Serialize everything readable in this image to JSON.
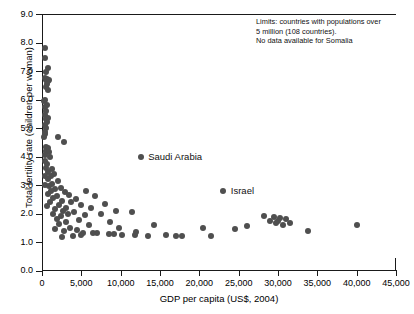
{
  "chart_data": {
    "type": "scatter",
    "title": "",
    "xlabel": "GDP per capita (US$, 2004)",
    "ylabel": "Total fertility rate (children per woman)",
    "xlim": [
      0,
      45000
    ],
    "ylim": [
      0,
      9.0
    ],
    "xticks": [
      0,
      5000,
      10000,
      15000,
      20000,
      25000,
      30000,
      35000,
      40000,
      45000
    ],
    "xtick_labels": [
      "0",
      "5,000",
      "10,000",
      "15,000",
      "20,000",
      "25,000",
      "30,000",
      "35,000",
      "40,000",
      "45,000"
    ],
    "yticks": [
      0,
      1,
      2,
      3,
      4,
      5,
      6,
      7,
      8,
      9
    ],
    "ytick_labels": [
      "0.0",
      "1.0",
      "2.0",
      "3.0",
      "4.0",
      "5.0",
      "6.0",
      "7.0",
      "8.0",
      "9.0"
    ],
    "grid": false,
    "legend": null,
    "marker_color": "#4f4f4f",
    "marker_size_px": 6,
    "annotations": [
      {
        "name": "limits-note",
        "lines": [
          "Limits: countries with populations over",
          "5 million (108 countries).",
          "No data available for Somalia"
        ],
        "x": 26000,
        "y": 8.85
      },
      {
        "name": "saudi-arabia-label",
        "text": "Saudi Arabia",
        "x": 13500,
        "y": 4.0,
        "point": [
          12600,
          4.0
        ]
      },
      {
        "name": "israel-label",
        "text": "Israel",
        "x": 24000,
        "y": 2.8,
        "point": [
          23000,
          2.8
        ]
      }
    ],
    "points": [
      [
        350,
        7.8
      ],
      [
        420,
        7.45
      ],
      [
        700,
        7.1
      ],
      [
        480,
        6.95
      ],
      [
        330,
        6.75
      ],
      [
        500,
        6.7
      ],
      [
        620,
        6.72
      ],
      [
        780,
        6.65
      ],
      [
        900,
        6.7
      ],
      [
        660,
        6.55
      ],
      [
        560,
        6.45
      ],
      [
        820,
        6.35
      ],
      [
        330,
        6.0
      ],
      [
        300,
        5.95
      ],
      [
        620,
        5.8
      ],
      [
        420,
        5.75
      ],
      [
        560,
        5.6
      ],
      [
        380,
        5.45
      ],
      [
        700,
        5.35
      ],
      [
        500,
        5.3
      ],
      [
        640,
        5.2
      ],
      [
        340,
        5.1
      ],
      [
        560,
        5.0
      ],
      [
        330,
        4.85
      ],
      [
        430,
        4.8
      ],
      [
        300,
        4.7
      ],
      [
        2050,
        4.7
      ],
      [
        2750,
        4.5
      ],
      [
        480,
        4.35
      ],
      [
        700,
        4.3
      ],
      [
        560,
        4.2
      ],
      [
        900,
        4.15
      ],
      [
        380,
        4.05
      ],
      [
        1050,
        4.0
      ],
      [
        12600,
        4.0
      ],
      [
        330,
        3.85
      ],
      [
        620,
        3.75
      ],
      [
        500,
        3.6
      ],
      [
        1250,
        3.55
      ],
      [
        820,
        3.45
      ],
      [
        1500,
        3.4
      ],
      [
        350,
        3.3
      ],
      [
        1100,
        3.3
      ],
      [
        700,
        3.2
      ],
      [
        2050,
        3.15
      ],
      [
        1300,
        3.05
      ],
      [
        400,
        3.0
      ],
      [
        900,
        2.95
      ],
      [
        2400,
        2.9
      ],
      [
        1700,
        2.85
      ],
      [
        1150,
        2.8
      ],
      [
        5600,
        2.8
      ],
      [
        23000,
        2.8
      ],
      [
        2900,
        2.75
      ],
      [
        780,
        2.7
      ],
      [
        3400,
        2.65
      ],
      [
        1900,
        2.6
      ],
      [
        6700,
        2.6
      ],
      [
        1400,
        2.55
      ],
      [
        4300,
        2.5
      ],
      [
        2550,
        2.45
      ],
      [
        3700,
        2.4
      ],
      [
        1050,
        2.4
      ],
      [
        8000,
        2.35
      ],
      [
        2150,
        2.3
      ],
      [
        5000,
        2.3
      ],
      [
        620,
        2.25
      ],
      [
        3100,
        2.2
      ],
      [
        6200,
        2.2
      ],
      [
        1700,
        2.15
      ],
      [
        9400,
        2.1
      ],
      [
        2700,
        2.1
      ],
      [
        4100,
        2.05
      ],
      [
        11500,
        2.05
      ],
      [
        1350,
        2.0
      ],
      [
        3300,
        2.0
      ],
      [
        7500,
        1.98
      ],
      [
        5500,
        1.95
      ],
      [
        2400,
        1.9
      ],
      [
        28200,
        1.9
      ],
      [
        29500,
        1.88
      ],
      [
        30300,
        1.85
      ],
      [
        31000,
        1.8
      ],
      [
        1900,
        1.8
      ],
      [
        4700,
        1.78
      ],
      [
        29000,
        1.75
      ],
      [
        30000,
        1.72
      ],
      [
        8600,
        1.7
      ],
      [
        3000,
        1.7
      ],
      [
        29800,
        1.68
      ],
      [
        31500,
        1.65
      ],
      [
        2200,
        1.62
      ],
      [
        6000,
        1.6
      ],
      [
        14200,
        1.6
      ],
      [
        30600,
        1.58
      ],
      [
        40000,
        1.6
      ],
      [
        26000,
        1.55
      ],
      [
        3600,
        1.5
      ],
      [
        9800,
        1.5
      ],
      [
        20500,
        1.5
      ],
      [
        1600,
        1.45
      ],
      [
        4400,
        1.42
      ],
      [
        24500,
        1.45
      ],
      [
        2800,
        1.38
      ],
      [
        33800,
        1.4
      ],
      [
        12000,
        1.35
      ],
      [
        5200,
        1.3
      ],
      [
        7000,
        1.3
      ],
      [
        8500,
        1.28
      ],
      [
        9200,
        1.27
      ],
      [
        10200,
        1.25
      ],
      [
        11800,
        1.25
      ],
      [
        13500,
        1.22
      ],
      [
        15800,
        1.25
      ],
      [
        17000,
        1.22
      ],
      [
        17800,
        1.22
      ],
      [
        21500,
        1.22
      ],
      [
        3900,
        1.2
      ],
      [
        2600,
        1.18
      ],
      [
        6500,
        1.32
      ],
      [
        4900,
        1.25
      ]
    ]
  }
}
